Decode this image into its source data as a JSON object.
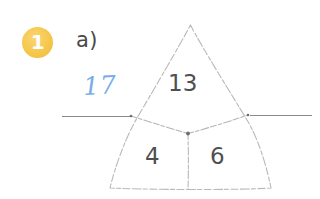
{
  "page": {
    "background_color": "#ffffff",
    "width": 320,
    "height": 199
  },
  "exercise": {
    "number_badge": {
      "label": "1",
      "fill_color": "#f5c64a",
      "text_color": "#ffffff"
    },
    "part_label": "a)"
  },
  "student_answer": {
    "value": "17",
    "ink_color": "#79ade8",
    "style": "handwritten"
  },
  "answer_lines": [
    {
      "id": "left-answer-line",
      "color": "#8a8a8a"
    },
    {
      "id": "right-answer-line",
      "color": "#8a8a8a"
    }
  ],
  "diagram": {
    "type": "number-triangle",
    "stroke_color": "#b9b9b9",
    "cells": {
      "top": "13",
      "bottom_left": "4",
      "bottom_right": "6"
    }
  }
}
